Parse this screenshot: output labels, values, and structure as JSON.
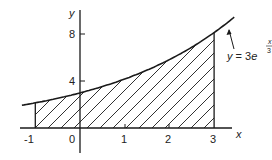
{
  "diagram": {
    "axes": {
      "x_label": "x",
      "y_label": "y",
      "x_ticks": [
        "-1",
        "0",
        "1",
        "2",
        "3"
      ],
      "y_ticks": [
        "4",
        "8"
      ],
      "origin_label": "0"
    },
    "curve": {
      "equation_prefix": "y = 3e",
      "exponent_numerator": "x",
      "exponent_denominator": "3"
    },
    "shaded_region": {
      "x_from": -1,
      "x_to": 3,
      "pattern": "diagonal hatching"
    },
    "colors": {
      "stroke": "#1a1a1a",
      "background": "#ffffff"
    }
  },
  "chart_data": {
    "type": "line",
    "title": "",
    "xlabel": "x",
    "ylabel": "y",
    "function": "y = 3e^(x/3)",
    "x": [
      -1.3,
      -1,
      0,
      1,
      2,
      3,
      3.3
    ],
    "values": [
      1.95,
      2.15,
      3.0,
      4.19,
      5.84,
      8.15,
      9.0
    ],
    "xticks": [
      -1,
      0,
      1,
      2,
      3
    ],
    "yticks": [
      4,
      8
    ],
    "shaded_interval": [
      -1,
      3
    ],
    "xlim": [
      -1.3,
      3.5
    ],
    "ylim": [
      -2,
      9.5
    ]
  }
}
